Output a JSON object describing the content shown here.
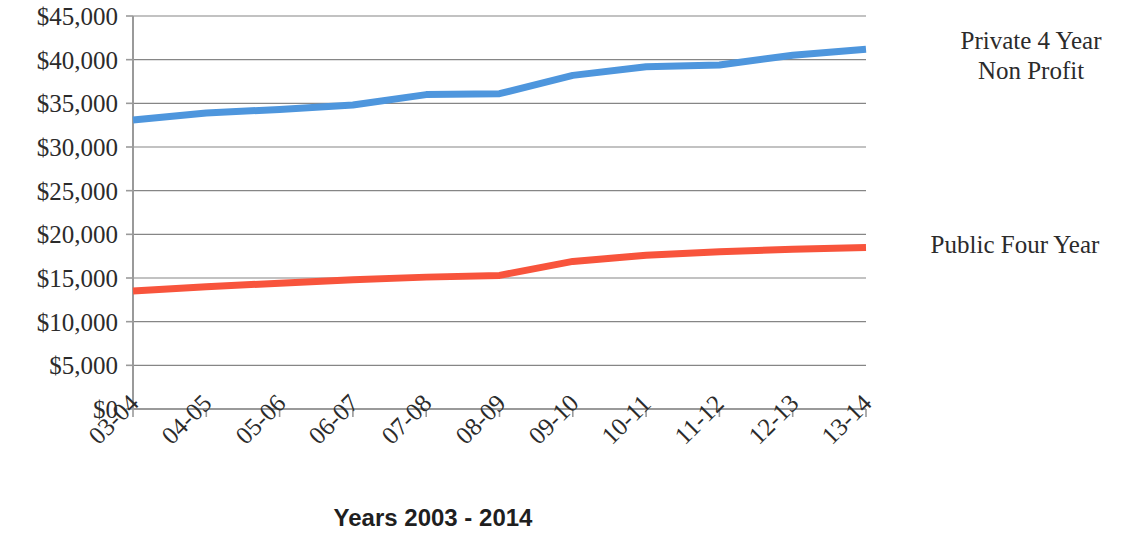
{
  "chart_data": {
    "type": "line",
    "title": "",
    "xlabel": "Years 2003 - 2014",
    "ylabel": "",
    "categories": [
      "03-04",
      "04-05",
      "05-06",
      "06-07",
      "07-08",
      "08-09",
      "09-10",
      "10-11",
      "11-12",
      "12-13",
      "13-14"
    ],
    "ylim": [
      0,
      45000
    ],
    "ytick_values": [
      0,
      5000,
      10000,
      15000,
      20000,
      25000,
      30000,
      35000,
      40000,
      45000
    ],
    "ytick_labels": [
      "$0",
      "$5,000",
      "$10,000",
      "$15,000",
      "$20,000",
      "$25,000",
      "$30,000",
      "$35,000",
      "$40,000",
      "$45,000"
    ],
    "grid": "horizontal",
    "legend_position": "right",
    "series": [
      {
        "name": "Private 4 Year Non Profit",
        "color": "#4E96DD",
        "values": [
          33100,
          33900,
          34300,
          34800,
          36000,
          36100,
          38200,
          39200,
          39400,
          40500,
          41200
        ]
      },
      {
        "name": "Public Four Year",
        "color": "#F8543C",
        "values": [
          13500,
          14000,
          14400,
          14800,
          15100,
          15300,
          16900,
          17600,
          18000,
          18300,
          18500
        ]
      }
    ]
  },
  "axis": {
    "x_title": "Years 2003 - 2014"
  },
  "legend": {
    "private_label": "Private 4 Year\nNon Profit",
    "public_label": "Public Four Year"
  },
  "colors": {
    "series_private": "#4E96DD",
    "series_public": "#F8543C",
    "gridline": "#868686",
    "axis": "#9a9a9a",
    "text": "#2b2b2b"
  }
}
